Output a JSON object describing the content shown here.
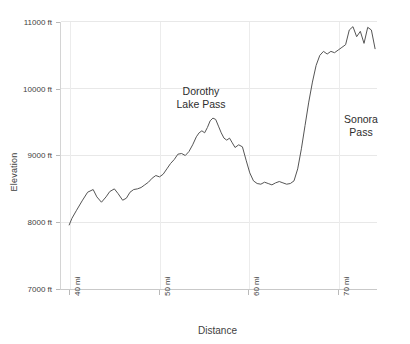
{
  "chart_data": {
    "type": "line",
    "title": "",
    "xlabel": "Distance",
    "ylabel": "Elevation",
    "xlim": [
      39.0,
      73.3
    ],
    "ylim": [
      7000,
      11000
    ],
    "grid": true,
    "legend": null,
    "x_tick_labels": [
      "40 mi",
      "50 mi",
      "60 mi",
      "70 mi"
    ],
    "x_ticks": [
      40,
      50,
      60,
      70
    ],
    "y_tick_labels": [
      "7000 ft",
      "8000 ft",
      "9000 ft",
      "10000 ft",
      "11000 ft"
    ],
    "y_ticks": [
      7000,
      8000,
      9000,
      10000,
      11000
    ],
    "line_color": "#555555",
    "series": [
      {
        "name": "Pacific Crest Trail elevation profile",
        "x": [
          40.0,
          40.3,
          40.8,
          41.4,
          42.0,
          42.6,
          43.0,
          43.5,
          44.0,
          44.4,
          44.9,
          45.3,
          45.8,
          46.2,
          46.6,
          47.0,
          47.4,
          47.8,
          48.2,
          48.6,
          49.0,
          49.4,
          49.8,
          50.2,
          50.6,
          51.0,
          51.4,
          51.8,
          52.2,
          52.6,
          53.0,
          53.4,
          53.8,
          54.1,
          54.4,
          54.7,
          55.0,
          55.3,
          55.6,
          55.9,
          56.2,
          56.5,
          56.8,
          57.1,
          57.4,
          57.7,
          58.0,
          58.4,
          58.8,
          59.2,
          59.6,
          60.0,
          60.4,
          60.8,
          61.2,
          61.6,
          62.0,
          62.4,
          62.8,
          63.2,
          63.6,
          64.0,
          64.4,
          64.8,
          65.2,
          65.6,
          66.0,
          66.4,
          66.8,
          67.2,
          67.6,
          68.0,
          68.4,
          68.8,
          69.2,
          69.6,
          70.0,
          70.4,
          70.8,
          71.2,
          71.6,
          72.0,
          72.4,
          72.8,
          73.2
        ],
        "y": [
          7960,
          8060,
          8180,
          8320,
          8450,
          8490,
          8380,
          8300,
          8380,
          8460,
          8500,
          8430,
          8330,
          8360,
          8450,
          8490,
          8500,
          8520,
          8560,
          8600,
          8660,
          8700,
          8680,
          8720,
          8800,
          8880,
          8940,
          9020,
          9030,
          9000,
          9060,
          9160,
          9280,
          9340,
          9370,
          9340,
          9420,
          9520,
          9560,
          9540,
          9440,
          9340,
          9260,
          9230,
          9260,
          9190,
          9120,
          9160,
          9130,
          8930,
          8740,
          8620,
          8580,
          8570,
          8600,
          8580,
          8560,
          8590,
          8610,
          8590,
          8570,
          8580,
          8620,
          8800,
          9100,
          9450,
          9800,
          10100,
          10350,
          10500,
          10560,
          10520,
          10560,
          10540,
          10580,
          10620,
          10660,
          10880,
          10930,
          10780,
          10860,
          10680,
          10920,
          10880,
          10600
        ]
      }
    ]
  },
  "annotations": [
    {
      "id": "dorothy-lake-pass",
      "text": "Dorothy\nLake Pass"
    },
    {
      "id": "sonora-pass",
      "text": "Sonora\nPass"
    }
  ]
}
